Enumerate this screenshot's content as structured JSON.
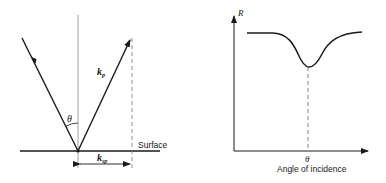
{
  "left_diagram": {
    "surface_label": "Surface",
    "angle_label": "θ",
    "kp_label": "k",
    "kp_sub": "p",
    "ksp_label": "k",
    "ksp_sub": "sp"
  },
  "right_diagram": {
    "y_axis_label": "R",
    "x_tick_label": "θ",
    "x_axis_label": "Angle of incidence"
  },
  "colors": {
    "line": "#1a1a1a",
    "thin_line": "#777777"
  }
}
